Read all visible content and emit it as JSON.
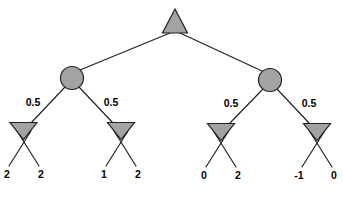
{
  "diagram": {
    "type": "expectiminimax-game-tree",
    "colors": {
      "node_fill": "#a3a3a3",
      "node_stroke": "#231f20",
      "edge_stroke": "#231f20",
      "label_color": "#000000",
      "background": "#ffffff"
    },
    "root": {
      "name": "max-node",
      "shape": "triangle-up",
      "label": ""
    },
    "chance_nodes": [
      {
        "name": "chance-node-left",
        "shape": "circle",
        "label": ""
      },
      {
        "name": "chance-node-right",
        "shape": "circle",
        "label": ""
      }
    ],
    "probabilities": [
      {
        "name": "prob-left-left",
        "value": "0.5"
      },
      {
        "name": "prob-left-right",
        "value": "0.5"
      },
      {
        "name": "prob-right-left",
        "value": "0.5"
      },
      {
        "name": "prob-right-right",
        "value": "0.5"
      }
    ],
    "min_nodes": [
      {
        "name": "min-node-1",
        "shape": "triangle-down",
        "label": ""
      },
      {
        "name": "min-node-2",
        "shape": "triangle-down",
        "label": ""
      },
      {
        "name": "min-node-3",
        "shape": "triangle-down",
        "label": ""
      },
      {
        "name": "min-node-4",
        "shape": "triangle-down",
        "label": ""
      }
    ],
    "leaves": [
      {
        "name": "leaf-1",
        "value": "2"
      },
      {
        "name": "leaf-2",
        "value": "2"
      },
      {
        "name": "leaf-3",
        "value": "1"
      },
      {
        "name": "leaf-4",
        "value": "2"
      },
      {
        "name": "leaf-5",
        "value": "0"
      },
      {
        "name": "leaf-6",
        "value": "2"
      },
      {
        "name": "leaf-7",
        "value": "-1"
      },
      {
        "name": "leaf-8",
        "value": "0"
      }
    ]
  }
}
